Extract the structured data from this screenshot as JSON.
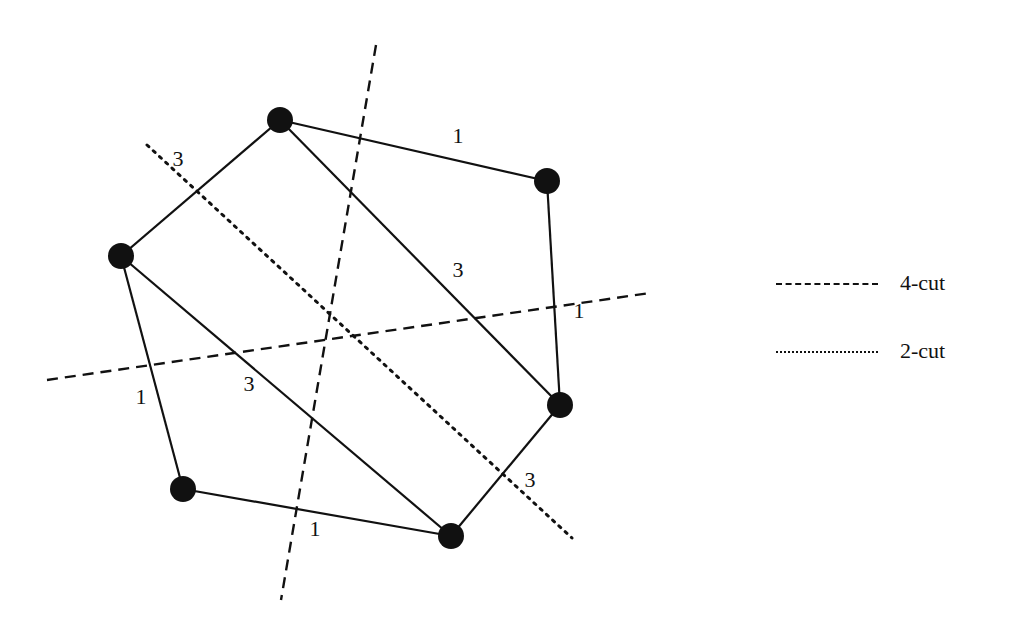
{
  "diagram": {
    "type": "weighted-graph-cuts",
    "colors": {
      "ink": "#111111",
      "background": "#ffffff"
    },
    "nodes": [
      {
        "id": "A",
        "x": 280,
        "y": 120
      },
      {
        "id": "B",
        "x": 547,
        "y": 181
      },
      {
        "id": "C",
        "x": 121,
        "y": 256
      },
      {
        "id": "D",
        "x": 560,
        "y": 405
      },
      {
        "id": "E",
        "x": 183,
        "y": 489
      },
      {
        "id": "F",
        "x": 451,
        "y": 536
      }
    ],
    "edges": [
      {
        "from": "A",
        "to": "B",
        "weight": "1",
        "label_x": 458,
        "label_y": 143
      },
      {
        "from": "A",
        "to": "C",
        "weight": "3",
        "label_x": 178,
        "label_y": 166
      },
      {
        "from": "A",
        "to": "D",
        "weight": "3",
        "label_x": 458,
        "label_y": 277
      },
      {
        "from": "B",
        "to": "D",
        "weight": "1",
        "label_x": 579,
        "label_y": 318
      },
      {
        "from": "C",
        "to": "E",
        "weight": "1",
        "label_x": 141,
        "label_y": 404
      },
      {
        "from": "C",
        "to": "F",
        "weight": "3",
        "label_x": 249,
        "label_y": 391
      },
      {
        "from": "E",
        "to": "F",
        "weight": "1",
        "label_x": 315,
        "label_y": 536
      },
      {
        "from": "F",
        "to": "D",
        "weight": "3",
        "label_x": 530,
        "label_y": 487
      }
    ],
    "cuts": [
      {
        "name": "4-cut-vertical",
        "style": "dashed",
        "x1": 376,
        "y1": 45,
        "x2": 281,
        "y2": 600
      },
      {
        "name": "4-cut-horizontal",
        "style": "dashed",
        "x1": 47,
        "y1": 380,
        "x2": 650,
        "y2": 293
      },
      {
        "name": "2-cut-diagonal",
        "style": "dotted",
        "x1": 147,
        "y1": 145,
        "x2": 572,
        "y2": 538
      }
    ],
    "legend": [
      {
        "style": "dashed",
        "label": "4-cut"
      },
      {
        "style": "dotted",
        "label": "2-cut"
      }
    ]
  }
}
